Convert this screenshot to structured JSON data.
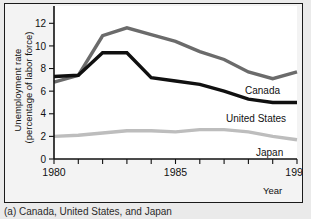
{
  "caption": "(a) Canada, United States, and Japan",
  "axis": {
    "y_title_line1": "Unemployment rate",
    "y_title_line2": "(percentage of labor force)",
    "x_title": "Year"
  },
  "chart_data": {
    "type": "line",
    "title": "",
    "subtitle": "",
    "xlabel": "Year",
    "ylabel": "Unemployment rate (percentage of labor force)",
    "x": [
      1980,
      1981,
      1982,
      1983,
      1984,
      1985,
      1986,
      1987,
      1988,
      1989,
      1990
    ],
    "xlim": [
      1980,
      1990
    ],
    "ylim": [
      0,
      13
    ],
    "yticks": [
      0,
      2,
      4,
      6,
      8,
      10,
      12
    ],
    "ytick_labels": [
      "0",
      "2",
      "4",
      "6",
      "8",
      "10",
      "12"
    ],
    "xticks": [
      1980,
      1981,
      1982,
      1983,
      1984,
      1985,
      1986,
      1987,
      1988,
      1989,
      1990
    ],
    "xtick_labels": [
      "1980",
      "",
      "",
      "",
      "",
      "1985",
      "",
      "",
      "",
      "",
      "1990"
    ],
    "xtick_labels_shown": [
      "1980",
      "1985",
      "1990"
    ],
    "grid": false,
    "legend": "inline-right-of-line-ends",
    "series": [
      {
        "name": "Canada",
        "color": "#6b6b6b",
        "width": 3.4,
        "values": [
          6.8,
          7.4,
          10.9,
          11.6,
          11.0,
          10.4,
          9.5,
          8.8,
          7.7,
          7.1,
          7.7
        ]
      },
      {
        "name": "United States",
        "color": "#101010",
        "width": 3.4,
        "values": [
          7.3,
          7.4,
          9.4,
          9.4,
          7.2,
          6.9,
          6.6,
          6.0,
          5.3,
          5.0,
          5.0
        ]
      },
      {
        "name": "Japan",
        "color": "#bdbdbd",
        "width": 3.4,
        "values": [
          2.0,
          2.1,
          2.3,
          2.5,
          2.5,
          2.4,
          2.6,
          2.6,
          2.4,
          2.0,
          1.7
        ]
      }
    ],
    "annotations": [
      {
        "text": "Canada",
        "series": "Canada"
      },
      {
        "text": "United States",
        "series": "United States"
      },
      {
        "text": "Japan",
        "series": "Japan"
      }
    ]
  }
}
